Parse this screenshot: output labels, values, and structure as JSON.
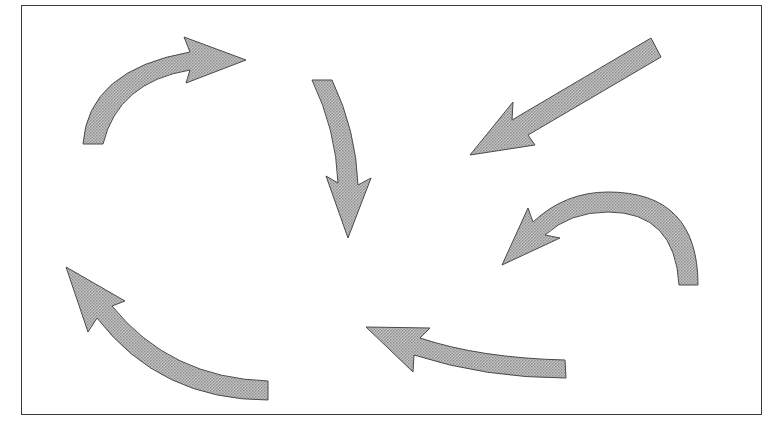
{
  "figure": {
    "frame_color": "#3a3a3a",
    "arrow_fill": "#b3b3b3",
    "arrow_stroke": "#4a4a4a",
    "arrows": [
      {
        "id": "curved-right",
        "direction": "up-right curving to right"
      },
      {
        "id": "curved-down",
        "direction": "down"
      },
      {
        "id": "straight-down-left",
        "direction": "down-left"
      },
      {
        "id": "curved-left-arc",
        "direction": "arcing over to left"
      },
      {
        "id": "curved-up-left",
        "direction": "up-left"
      },
      {
        "id": "curved-left",
        "direction": "left"
      }
    ]
  }
}
